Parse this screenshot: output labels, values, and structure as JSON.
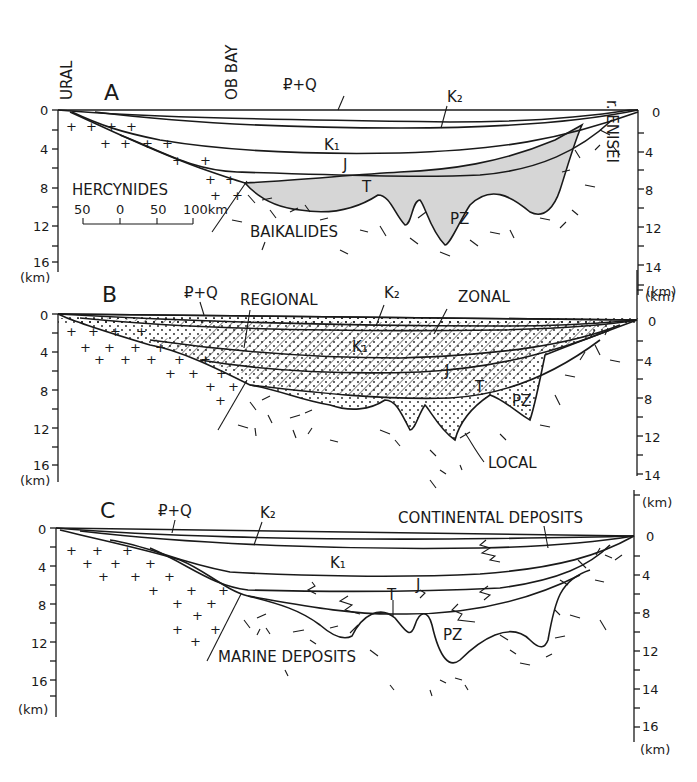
{
  "figure": {
    "top_labels": {
      "left": "URAL",
      "middle": "OB BAY",
      "right": "r. ENISEI"
    },
    "units": "(km)",
    "left_axis_ticks": [
      "0",
      "4",
      "8",
      "12",
      "16"
    ],
    "right_axis_ticks_A": [
      "0",
      "4",
      "8",
      "12",
      "14"
    ],
    "right_axis_ticks_B": [
      "0",
      "4",
      "8",
      "12",
      "14"
    ],
    "right_axis_ticks_C": [
      "0",
      "4",
      "8",
      "12",
      "14",
      "16"
    ],
    "colors": {
      "ink": "#1a1a1a",
      "pz_fill": "#d6d6d6",
      "background": "#ffffff"
    }
  },
  "panels": [
    {
      "id": "A",
      "letter": "A",
      "labels": {
        "pq": "₽+Q",
        "k2": "K₂",
        "k1": "K₁",
        "j": "J",
        "t": "T",
        "pz": "PZ",
        "hercynides": "HERCYNIDES",
        "baikalides": "BAIKALIDES"
      },
      "scale_bar": {
        "ticks": [
          "50",
          "0",
          "50",
          "100km"
        ]
      }
    },
    {
      "id": "B",
      "letter": "B",
      "labels": {
        "pq": "₽+Q",
        "k2": "K₂",
        "k1": "K₁",
        "j": "J",
        "t": "T",
        "pz": "PZ",
        "regional": "REGIONAL",
        "zonal": "ZONAL",
        "local": "LOCAL"
      }
    },
    {
      "id": "C",
      "letter": "C",
      "labels": {
        "pq": "₽+Q",
        "k2": "K₂",
        "k1": "K₁",
        "j": "J",
        "t": "T",
        "pz": "PZ",
        "continental": "CONTINENTAL DEPOSITS",
        "marine": "MARINE DEPOSITS"
      }
    }
  ]
}
